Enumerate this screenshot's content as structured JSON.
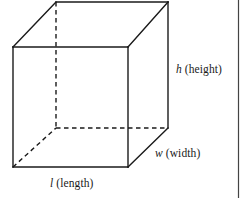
{
  "figure": {
    "name": "rectangular-prism-dimensions",
    "background_color": "#ffffff",
    "stroke_color": "#1a1a1a",
    "frame_border_color": "#444444"
  },
  "labels": {
    "height": {
      "variable": "h",
      "word": "(height)"
    },
    "width": {
      "variable": "w",
      "word": "(width)"
    },
    "length": {
      "variable": "l",
      "word": "(length)"
    }
  },
  "geometry": {
    "front_face": {
      "top_left": [
        13,
        47
      ],
      "top_right": [
        128,
        47
      ],
      "bottom_right": [
        128,
        167
      ],
      "bottom_left": [
        13,
        167
      ]
    },
    "back_face": {
      "top_left": [
        56,
        2
      ],
      "top_right": [
        168,
        2
      ],
      "bottom_right": [
        168,
        128
      ],
      "bottom_left": [
        56,
        128
      ]
    },
    "solid_edges": [
      "front-top",
      "front-right",
      "front-bottom",
      "front-left",
      "back-top",
      "top-left-diagonal",
      "top-right-diagonal",
      "back-right-vertical",
      "bottom-right-diagonal"
    ],
    "dashed_edges": [
      "hidden-back-left-vertical",
      "hidden-back-bottom",
      "hidden-bottom-left-diagonal"
    ]
  }
}
